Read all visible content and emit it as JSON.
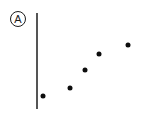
{
  "figure": {
    "width": 148,
    "height": 113,
    "background_color": "#ffffff"
  },
  "panel_label": {
    "text": "A",
    "shape": "circle",
    "icon_name": "circled-letter-label",
    "color": "#1c1c1c",
    "center_x": 18,
    "center_y": 19,
    "diameter": 16
  },
  "axis": {
    "orientation": "vertical",
    "color": "#555555",
    "x": 36,
    "y_top": 13,
    "y_bottom": 109,
    "thickness": 2,
    "has_ticks": false,
    "has_labels": false
  },
  "chart_data": {
    "type": "scatter",
    "title": "",
    "subtitle": "",
    "xlabel": "",
    "ylabel": "",
    "grid": false,
    "legend": null,
    "legend_position": "none",
    "annotations": [
      {
        "text": "A",
        "kind": "panel-label",
        "x": 18,
        "y": 19
      }
    ],
    "axis_ranges": {
      "x_pixel": [
        36,
        148
      ],
      "y_pixel": [
        13,
        109
      ],
      "xlim": [
        0,
        6
      ],
      "ylim": [
        0,
        6
      ]
    },
    "marker": {
      "shape": "circle",
      "color": "#0d0d0d",
      "size_px": 5
    },
    "x_tick_labels": [],
    "y_tick_labels": [],
    "series": [
      {
        "name": "series-1",
        "color": "#0d0d0d",
        "x": [
          1,
          2,
          3,
          4,
          5
        ],
        "y": [
          1.0,
          1.55,
          2.5,
          3.4,
          4.0
        ],
        "points_px": [
          {
            "x": 43,
            "y": 96
          },
          {
            "x": 70,
            "y": 88
          },
          {
            "x": 85,
            "y": 70
          },
          {
            "x": 99,
            "y": 54
          },
          {
            "x": 128,
            "y": 45
          }
        ]
      }
    ]
  }
}
